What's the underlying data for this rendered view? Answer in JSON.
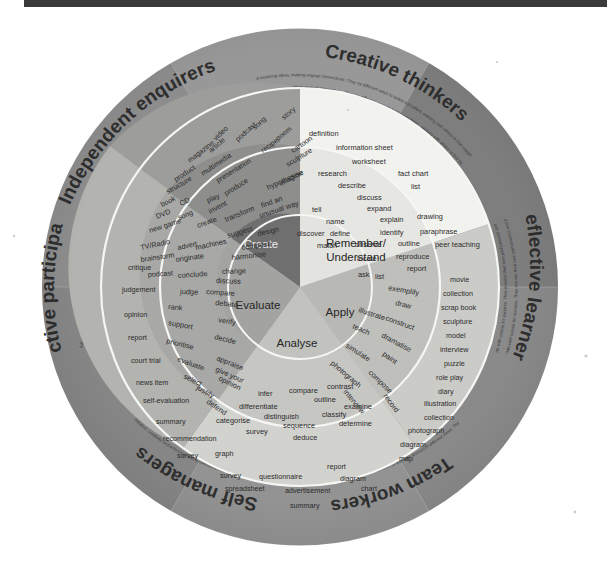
{
  "meta": {
    "style": "scanned grayscale circular diagram"
  },
  "colors": {
    "outer_ring": "#8c8c8c",
    "outer_ring_alt": "#7d7d7d",
    "create_band": "#9a9a9a",
    "create_core": "#6f6f6f",
    "remember_band": "#f1f1ef",
    "remember_core": "#e2e2de",
    "apply_band": "#c9c9c7",
    "apply_core": "#b9b9b6",
    "analyse_band": "#cfcfcd",
    "analyse_core": "#c3c3c0",
    "evaluate_band": "#b1b1af",
    "evaluate_core": "#a2a2a0",
    "divider": "#f4f4f2",
    "text": "#2b2b2b",
    "topbar": "#3a3a3a",
    "page": "#ffffff"
  },
  "core": {
    "label": "Bloom's Taxonomy domains",
    "segments": [
      {
        "id": "create",
        "label": "Create"
      },
      {
        "id": "remember",
        "label": "Remember/\nUnderstand",
        "line1": "Remember/",
        "line2": "Understand"
      },
      {
        "id": "apply",
        "label": "Apply"
      },
      {
        "id": "analyse",
        "label": "Analyse"
      },
      {
        "id": "evaluate",
        "label": "Evaluate"
      }
    ]
  },
  "verb_ring": {
    "label": "action verbs",
    "create": [
      "produce",
      "hypothesise",
      "invent",
      "find an",
      "unusual way",
      "transform",
      "create",
      "suggest",
      "design",
      "machines",
      "compose",
      "originate",
      "harmonise",
      "change"
    ],
    "remember": [
      "definition",
      "information sheet",
      "worksheet",
      "research",
      "describe",
      "fact chart",
      "discuss",
      "list",
      "tell",
      "expand",
      "name",
      "explain",
      "drawing",
      "discover",
      "define",
      "identify",
      "paraphrase",
      "match",
      "observe",
      "outline",
      "peer teaching",
      "locate",
      "reproduce",
      "ask",
      "list",
      "report"
    ],
    "apply": [
      "exemplify",
      "draw",
      "illustrate",
      "construct",
      "teach",
      "dramatise",
      "simulate",
      "paint",
      "photograph",
      "compose",
      "interview",
      "record"
    ],
    "analyse": [
      "infer",
      "compare",
      "contrast",
      "outline",
      "differentiate",
      "examine",
      "distinguish",
      "classify",
      "categorise",
      "sequence",
      "determine",
      "survey",
      "deduce"
    ],
    "evaluate": [
      "conclude",
      "discuss",
      "judge",
      "compare",
      "debate",
      "rank",
      "verify",
      "support",
      "decide",
      "prioritise",
      "evaluate",
      "appraise",
      "give your",
      "opinion",
      "select",
      "justify",
      "defend"
    ]
  },
  "product_ring": {
    "label": "learning products and outcomes",
    "create": [
      "story",
      "song",
      "video",
      "podcast",
      "poem",
      "article",
      "recipe",
      "cartoon",
      "magazine",
      "sculpture",
      "multimedia",
      "product",
      "presentation",
      "structure",
      "imagine",
      "book",
      "CD",
      "play",
      "DVD",
      "song",
      "new game",
      "TV/Radio",
      "advert",
      "brainstorm",
      "podcast"
    ],
    "apply": [
      "movie",
      "collection",
      "scrap book",
      "sculpture",
      "model",
      "interview",
      "puzzle",
      "role play",
      "diary",
      "illustration",
      "collection",
      "photograph",
      "diagram",
      "map"
    ],
    "analyse": [
      "graph",
      "survey",
      "questionnaire",
      "report",
      "diagram",
      "spreadsheet",
      "advertisement",
      "chart",
      "summary"
    ],
    "evaluate": [
      "critique",
      "judgement",
      "opinion",
      "report",
      "court trial",
      "news item",
      "self-evaluation",
      "summary",
      "recommendation",
      "survey"
    ]
  },
  "plts": {
    "label": "Personal Learning and Thinking Skills",
    "petals": [
      {
        "id": "independent-enquirers",
        "title": "Independent enquirers",
        "desc": "Young people process and evaluate information in their investigations, planning what to do and how to go about it. They take informed and well-reasoned decisions, recognising that others have different beliefs and attitudes."
      },
      {
        "id": "creative-thinkers",
        "title": "Creative thinkers",
        "desc": "Young people think creatively by generating and exploring ideas, making original connections. They try different ways to tackle a problem, working with others to find imaginative solutions and outcomes that are of value."
      },
      {
        "id": "reflective-learners",
        "title": "Reflective learners",
        "desc": "Young people evaluate their strengths and limitations, setting themselves realistic goals with criteria for success. They monitor their own performance and progress, inviting feedback from others and making changes to further their learning."
      },
      {
        "id": "team-workers",
        "title": "Team workers",
        "desc": "Young people work confidently with others, adapting to different contexts and taking responsibility for their own part. They listen to and take account of different views. They form collaborative relationships, resolving issues to reach agreed outcomes."
      },
      {
        "id": "self-managers",
        "title": "Self managers",
        "desc": "Young people organise themselves, showing personal responsibility, initiative, creativity and enterprise with a commitment to learning and self-improvement. They actively embrace change, responding positively to new priorities."
      },
      {
        "id": "effective-participators",
        "title": "Effective participators",
        "desc": "Young people actively engage with issues that affect them and those around them. They play a full part in the life of their school, college, workplace or wider community by taking responsible action to bring improvements for others as well as themselves."
      }
    ]
  }
}
